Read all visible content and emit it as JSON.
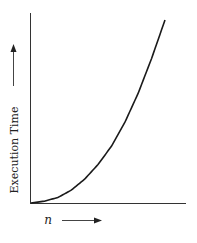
{
  "chart_data": {
    "type": "line",
    "title": "",
    "xlabel": "n",
    "ylabel": "Execution Time",
    "grid": false,
    "legend": null,
    "x_ticks": [],
    "y_ticks": [],
    "series": [
      {
        "name": "Execution Time",
        "description": "Convex, monotonically increasing curve (polynomial/exponential growth) starting at origin",
        "x": [
          0,
          0.1,
          0.2,
          0.3,
          0.4,
          0.5,
          0.6,
          0.7,
          0.8,
          0.9,
          1.0
        ],
        "values": [
          0,
          0.01,
          0.03,
          0.07,
          0.13,
          0.21,
          0.31,
          0.44,
          0.6,
          0.79,
          1.0
        ]
      }
    ],
    "xlim": [
      0,
      1
    ],
    "ylim": [
      0,
      1
    ]
  },
  "labels": {
    "x_axis": "n",
    "y_axis": "Execution Time"
  },
  "colors": {
    "line": "#1a1a1a",
    "axis": "#333333",
    "background": "#ffffff"
  }
}
